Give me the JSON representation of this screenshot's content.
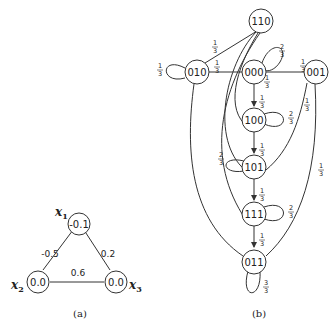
{
  "figure_a": {
    "caption": "(a)",
    "nodes": [
      {
        "id": "x1",
        "var": "x",
        "sub": "1",
        "value": "-0.1"
      },
      {
        "id": "x2",
        "var": "x",
        "sub": "2",
        "value": "0.0"
      },
      {
        "id": "x3",
        "var": "x",
        "sub": "3",
        "value": "0.0"
      }
    ],
    "edges": [
      {
        "from": "x1",
        "to": "x2",
        "weight": "-0.5"
      },
      {
        "from": "x1",
        "to": "x3",
        "weight": "0.2"
      },
      {
        "from": "x2",
        "to": "x3",
        "weight": "0.6"
      }
    ]
  },
  "figure_b": {
    "caption": "(b)",
    "nodes": [
      "110",
      "010",
      "000",
      "001",
      "100",
      "101",
      "111",
      "011"
    ],
    "edge_labels": {
      "self_010": {
        "num": "1",
        "den": "3"
      },
      "e010_110": {
        "num": "1",
        "den": "3"
      },
      "e010_000": {
        "num": "1",
        "den": "3"
      },
      "self_000": {
        "num": "2",
        "den": "3"
      },
      "e000_001": {
        "num": "1",
        "den": "3"
      },
      "e000_x": {
        "num": "1",
        "den": "3"
      },
      "e000_100": {
        "num": "1",
        "den": "3"
      },
      "self_100": {
        "num": "2",
        "den": "3"
      },
      "e001_101": {
        "num": "1",
        "den": "3"
      },
      "e100_101": {
        "num": "1",
        "den": "3"
      },
      "self_101": {
        "num": "2",
        "den": "3"
      },
      "e101_111": {
        "num": "1",
        "den": "3"
      },
      "self_111": {
        "num": "2",
        "den": "3"
      },
      "e001_011": {
        "num": "1",
        "den": "3"
      },
      "e111_011": {
        "num": "1",
        "den": "3"
      },
      "self_011": {
        "num": "3",
        "den": "3"
      }
    }
  }
}
